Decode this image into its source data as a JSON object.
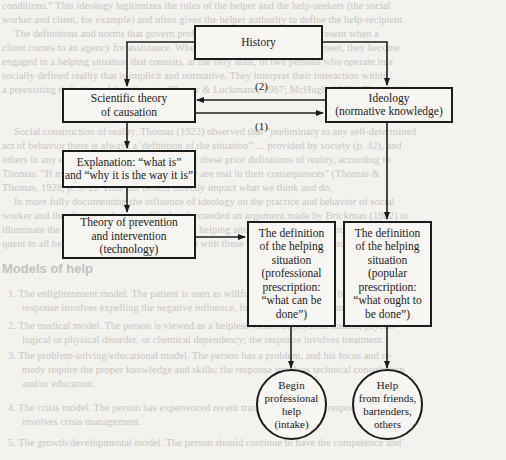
{
  "background_text": {
    "lines": [
      "conditions.\" This ideology legitimizes the roles of the helper and the help-seekers (the social",
      "worker and client, for example) and often gives the helper authority to define the help-recipient.",
      "The definitions and norms that govern professional practice are already present when a",
      "client comes to an agency for assistance. When the client and social worker meet, they become",
      "engaged in a helping situation that consists, at the very least, of two persons who operate in a",
      "socially defined reality that is implicit and normative. They interpret their interaction within",
      "a preexisting definition of the situation (Berger & Luckmann, 1967; McHugh, 1968). Thus, Weber",
      "Social construction of reality. Thomas (1923) observed that \"preliminary to any self-determined",
      "act of behavior there is always a 'definition of the situation'\" ... provided by society (p. 42), and",
      "others in any encounter determined, in part, by these prior definitions of reality, according to",
      "Thomas. \"If men define situations as real, they are real in their consequences\" (Thomas &",
      "Thomas, 1928, p. 572). Thus our beliefs directly impact what we think and do.",
      "In more fully documenting the influence of ideology on the practice and behavior of social",
      "worker and the client, we have modified and extended an argument made by Brickman (1982) to",
      "illuminate the structure of the definition of the helping situation. Moreover, it strongly conse-",
      "quent to all helping practices, it is a discussion with those involved in these definitions."
    ],
    "heading": "Models of help",
    "list": [
      "1. The enlightenment model. The patient is seen as willfully bad — possessed by evil spirits; the",
      "response involves expelling the negative influence, for example, by exorcism.",
      "2. The medical model. The person is viewed as a helpless victim of physical trauma, psycho-",
      "logical or physical disorder, or chemical dependency; the response involves treatment.",
      "3. The problem-solving/educational model. The person has a problem, and his focus and re-",
      "medy require the proper knowledge and skills; the response involves technical consultation",
      "and/or education.",
      "4. The crisis model. The person has experienced recent trauma or crisis; the response",
      "involves crisis management.",
      "5. The growth/developmental model. The person should continue to have the competence and"
    ]
  },
  "diagram": {
    "nodes": {
      "history": {
        "lines": [
          "History"
        ]
      },
      "scientific_theory": {
        "lines": [
          "Scientific theory",
          "of causation"
        ]
      },
      "ideology": {
        "lines": [
          "Ideology",
          "(normative knowledge)"
        ]
      },
      "explanation": {
        "lines": [
          "Explanation: “what is”",
          "and “why it is the way it is”"
        ]
      },
      "theory_prevention": {
        "lines": [
          "Theory of prevention",
          "and intervention",
          "(technology)"
        ]
      },
      "definition_professional": {
        "lines": [
          "The definition",
          "of the helping",
          "situation",
          "(professional",
          "prescription:",
          "“what can be",
          "done”)"
        ]
      },
      "definition_popular": {
        "lines": [
          "The definition",
          "of the helping",
          "situation",
          "(popular",
          "prescription:",
          "“what ought to",
          "be done”)"
        ]
      },
      "begin_professional_help": {
        "lines": [
          "Begin",
          "professional",
          "help",
          "(intake)"
        ]
      },
      "help_from_friends": {
        "lines": [
          "Help",
          "from friends,",
          "bartenders,",
          "others"
        ]
      }
    },
    "edge_labels": {
      "ideology_to_science": "(2)",
      "science_to_ideology": "(1)"
    },
    "edges": [
      {
        "from": "history",
        "to": "scientific_theory"
      },
      {
        "from": "history",
        "to": "ideology"
      },
      {
        "from": "ideology",
        "to": "scientific_theory",
        "label": "(2)"
      },
      {
        "from": "scientific_theory",
        "to": "ideology",
        "label": "(1)"
      },
      {
        "from": "scientific_theory",
        "to": "explanation"
      },
      {
        "from": "explanation",
        "to": "theory_prevention"
      },
      {
        "from": "theory_prevention",
        "to": "definition_professional"
      },
      {
        "from": "ideology",
        "to": "definition_popular"
      },
      {
        "from": "definition_professional",
        "to": "begin_professional_help"
      },
      {
        "from": "definition_popular",
        "to": "help_from_friends"
      }
    ],
    "colors": {
      "stroke": "#1c1c1c",
      "page": "#f3f2ef",
      "faded_text": "#c9c7c2"
    }
  }
}
